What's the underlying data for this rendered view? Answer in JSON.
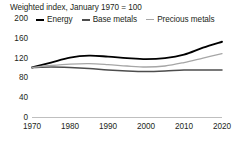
{
  "chart_data": {
    "type": "line",
    "title": "Weighted index, January 1970 = 100",
    "xlabel": "",
    "ylabel": "",
    "xlim": [
      1970,
      2020
    ],
    "ylim": [
      0,
      200
    ],
    "grid": false,
    "legend_position": "top",
    "x_ticks": [
      "1970",
      "1980",
      "1990",
      "2000",
      "2010",
      "2020"
    ],
    "y_ticks": [
      "0",
      "40",
      "80",
      "120",
      "160",
      "200"
    ],
    "x": [
      1970,
      1975,
      1980,
      1985,
      1990,
      1995,
      2000,
      2005,
      2010,
      2015,
      2020
    ],
    "series": [
      {
        "name": "Energy",
        "color": "#000000",
        "values": [
          100,
          110,
          120,
          124,
          122,
          119,
          117,
          119,
          126,
          140,
          152
        ]
      },
      {
        "name": "Base metals",
        "color": "#4d4d4d",
        "values": [
          100,
          101,
          100,
          98,
          95,
          93,
          92,
          93,
          95,
          95,
          95
        ]
      },
      {
        "name": "Precious metals",
        "color": "#a6a6a6",
        "values": [
          100,
          104,
          107,
          108,
          106,
          103,
          101,
          103,
          110,
          119,
          128
        ]
      }
    ]
  },
  "legend": {
    "items": [
      {
        "label": "Energy"
      },
      {
        "label": "Base metals"
      },
      {
        "label": "Precious metals"
      }
    ]
  }
}
